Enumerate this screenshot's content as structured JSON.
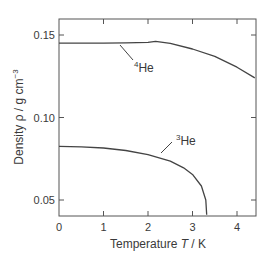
{
  "chart_data": {
    "type": "line",
    "title": "",
    "xlabel": "Temperature T / K",
    "xlabel_parts": {
      "pre": "Temperature ",
      "italic": "T",
      "post": " / K"
    },
    "ylabel": "Density ρ / g cm⁻³",
    "ylabel_parts": {
      "pre": "Density ρ / g cm",
      "sup": "−3"
    },
    "xlim": [
      0,
      4.4
    ],
    "ylim": [
      0.04,
      0.16
    ],
    "xticks": [
      0,
      1,
      2,
      3,
      4
    ],
    "xtick_labels": [
      "0",
      "1",
      "2",
      "3",
      "4"
    ],
    "yticks": [
      0.05,
      0.1,
      0.15
    ],
    "ytick_labels": [
      "0.05",
      "0.10",
      "0.15"
    ],
    "grid": false,
    "legend": "none (inline annotations)",
    "series": [
      {
        "name": "4He",
        "label_sup": "4",
        "label_main": "He",
        "x": [
          0.0,
          0.5,
          1.0,
          1.5,
          2.0,
          2.17,
          2.5,
          3.0,
          3.5,
          4.0,
          4.4
        ],
        "y": [
          0.1451,
          0.1451,
          0.1451,
          0.1452,
          0.1455,
          0.1462,
          0.145,
          0.1415,
          0.137,
          0.1305,
          0.124
        ]
      },
      {
        "name": "3He",
        "label_sup": "3",
        "label_main": "He",
        "x": [
          0.0,
          0.5,
          1.0,
          1.5,
          2.0,
          2.5,
          2.8,
          3.0,
          3.2,
          3.3,
          3.32
        ],
        "y": [
          0.0825,
          0.0822,
          0.0815,
          0.08,
          0.0775,
          0.0735,
          0.0695,
          0.0655,
          0.0585,
          0.05,
          0.041
        ]
      }
    ],
    "annotations": [
      {
        "text": "4He",
        "points_to_series": "4He"
      },
      {
        "text": "3He",
        "points_to_series": "3He"
      }
    ]
  }
}
